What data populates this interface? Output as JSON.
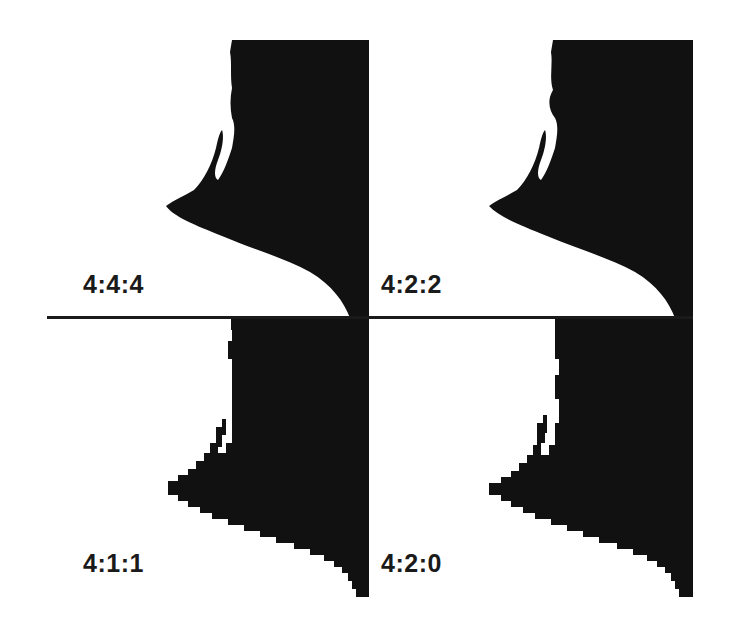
{
  "figure": {
    "panels": [
      {
        "id": "top-left",
        "label": "4:4:4"
      },
      {
        "id": "top-right",
        "label": "4:2:2"
      },
      {
        "id": "bottom-left",
        "label": "4:1:1"
      },
      {
        "id": "bottom-right",
        "label": "4:2:0"
      }
    ],
    "colors": {
      "silhouette": "#111111",
      "background": "#ffffff",
      "divider": "#1a1a1a"
    }
  }
}
